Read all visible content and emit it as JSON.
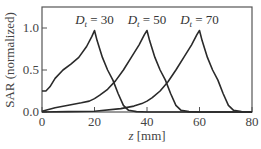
{
  "chart_data": {
    "type": "line",
    "title": "",
    "xlabel": "z [mm]",
    "ylabel": "SAR (normalized)",
    "xlim": [
      0,
      80
    ],
    "ylim": [
      0,
      1.25
    ],
    "xticks": [
      0,
      20,
      40,
      60,
      80
    ],
    "xtick_labels": [
      "0",
      "20",
      "40",
      "60",
      "80"
    ],
    "yticks": [
      0.0,
      0.5,
      1.0
    ],
    "ytick_labels": [
      "0.0",
      "0.5",
      "1.0"
    ],
    "grid": false,
    "legend": null,
    "annotations": [
      {
        "text_main": "D",
        "text_sub": "t",
        "text_rest": " = 30",
        "x": 20,
        "y": 1.05
      },
      {
        "text_main": "D",
        "text_sub": "t",
        "text_rest": " = 50",
        "x": 40,
        "y": 1.05
      },
      {
        "text_main": "D",
        "text_sub": "t",
        "text_rest": " = 70",
        "x": 60,
        "y": 1.05
      }
    ],
    "series": [
      {
        "name": "Dt = 30",
        "x": [
          0,
          1.5,
          3,
          5,
          8,
          11,
          14,
          17,
          19,
          20,
          21,
          23,
          25,
          27,
          29,
          31,
          33,
          36,
          40,
          50,
          60,
          80
        ],
        "y": [
          0.25,
          0.25,
          0.3,
          0.4,
          0.5,
          0.57,
          0.65,
          0.78,
          0.9,
          0.97,
          0.85,
          0.65,
          0.5,
          0.38,
          0.22,
          0.08,
          0.02,
          0.005,
          0.0,
          0.0,
          0.0,
          0.0
        ]
      },
      {
        "name": "Dt = 50",
        "x": [
          0,
          5,
          10,
          15,
          18,
          20,
          22,
          25,
          28,
          31,
          34,
          37,
          39,
          40,
          41,
          43,
          45,
          47,
          49,
          51,
          53,
          56,
          60,
          80
        ],
        "y": [
          0.01,
          0.05,
          0.08,
          0.11,
          0.13,
          0.16,
          0.2,
          0.27,
          0.37,
          0.5,
          0.65,
          0.8,
          0.92,
          0.97,
          0.85,
          0.65,
          0.5,
          0.38,
          0.22,
          0.08,
          0.02,
          0.005,
          0.0,
          0.0
        ]
      },
      {
        "name": "Dt = 70",
        "x": [
          0,
          10,
          20,
          30,
          35,
          38,
          40,
          42,
          45,
          48,
          51,
          54,
          57,
          59,
          60,
          61,
          63,
          65,
          67,
          69,
          71,
          73,
          76,
          80
        ],
        "y": [
          0.0,
          0.005,
          0.01,
          0.04,
          0.07,
          0.1,
          0.13,
          0.17,
          0.25,
          0.36,
          0.5,
          0.65,
          0.8,
          0.92,
          0.97,
          0.85,
          0.65,
          0.5,
          0.38,
          0.22,
          0.08,
          0.02,
          0.005,
          0.0
        ]
      }
    ]
  },
  "caption": "(a) Spatial dose pattern without body shadow"
}
